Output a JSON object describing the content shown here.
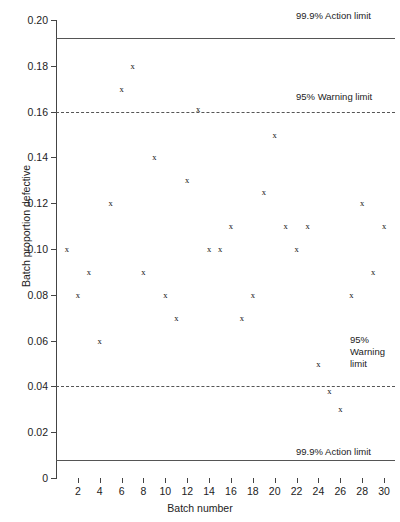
{
  "chart_data": {
    "type": "scatter",
    "title": "",
    "xlabel": "Batch number",
    "ylabel": "Batch proportion defective",
    "xlim": [
      0,
      31
    ],
    "ylim": [
      0,
      0.2
    ],
    "grid": false,
    "legend": "none",
    "marker": "x",
    "x": [
      1,
      2,
      3,
      4,
      5,
      6,
      7,
      8,
      9,
      10,
      11,
      12,
      13,
      14,
      15,
      16,
      17,
      18,
      19,
      20,
      21,
      22,
      23,
      24,
      25,
      26,
      27,
      28,
      29,
      30
    ],
    "values": [
      0.1,
      0.08,
      0.09,
      0.06,
      0.12,
      0.17,
      0.18,
      0.09,
      0.14,
      0.08,
      0.07,
      0.13,
      0.161,
      0.1,
      0.1,
      0.11,
      0.07,
      0.08,
      0.125,
      0.15,
      0.11,
      0.1,
      0.11,
      0.05,
      0.038,
      0.03,
      0.08,
      0.12,
      0.09,
      0.11
    ],
    "y_ticks": [
      0,
      0.02,
      0.04,
      0.06,
      0.08,
      0.1,
      0.12,
      0.14,
      0.16,
      0.18,
      0.2
    ],
    "y_tick_labels": [
      "0",
      "0.02",
      "0.04",
      "0.06",
      "0.08",
      "0.10",
      "0.12",
      "0.14",
      "0.16",
      "0.18",
      "0.20"
    ],
    "x_ticks": [
      2,
      4,
      6,
      8,
      10,
      12,
      14,
      16,
      18,
      20,
      22,
      24,
      26,
      28,
      30
    ],
    "x_tick_labels": [
      "2",
      "4",
      "6",
      "8",
      "10",
      "12",
      "14",
      "16",
      "18",
      "20",
      "22",
      "24",
      "26",
      "28",
      "30"
    ],
    "reference_lines": [
      {
        "id": "upper-action-limit",
        "value": 0.192,
        "style": "solid",
        "label": "99.9% Action limit",
        "label_pos": "above-right"
      },
      {
        "id": "upper-warning-limit",
        "value": 0.16,
        "style": "dashed",
        "label": "95% Warning limit",
        "label_pos": "above-right"
      },
      {
        "id": "lower-warning-limit",
        "value": 0.04,
        "style": "dashed",
        "label": "95%\nWarning\nlimit",
        "label_pos": "above-right"
      },
      {
        "id": "lower-action-limit",
        "value": 0.008,
        "style": "solid",
        "label": "99.9% Action limit",
        "label_pos": "above-right"
      }
    ],
    "line_color": "#555555",
    "marker_color": "#111111",
    "axis_color": "#444444",
    "background": "#ffffff"
  },
  "annotations": {
    "upper_action_label": "99.9% Action limit",
    "upper_warning_label": "95% Warning limit",
    "lower_warning_label_l1": "95%",
    "lower_warning_label_l2": "Warning",
    "lower_warning_label_l3": "limit",
    "lower_action_label": "99.9% Action limit"
  },
  "axis_titles": {
    "x": "Batch number",
    "y": "Batch proportion defective"
  }
}
